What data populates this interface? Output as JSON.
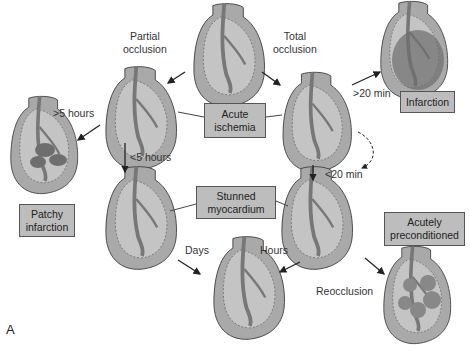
{
  "figure": {
    "panel_label": "A",
    "colors": {
      "heart_fill": "#a9a9a9",
      "heart_inner": "#c4c4c4",
      "infarct": "#6e6e6e",
      "box_fill": "#bdbdbd",
      "stroke": "#555555"
    }
  },
  "transitions": {
    "partial": [
      "Partial",
      "occlusion"
    ],
    "total": [
      "Total",
      "occlusion"
    ],
    "gt20": ">20 min",
    "lt20": "<20 min",
    "gt5": ">5 hours",
    "lt5": "<5 hours",
    "days": "Days",
    "hours": "Hours",
    "reocclusion": "Reocclusion"
  },
  "states": {
    "acute_ischemia": [
      "Acute",
      "ischemia"
    ],
    "infarction": [
      "Infarction"
    ],
    "patchy": [
      "Patchy",
      "infarction"
    ],
    "stunned": [
      "Stunned",
      "myocardium"
    ],
    "preconditioned": [
      "Acutely",
      "preconditioned"
    ]
  }
}
